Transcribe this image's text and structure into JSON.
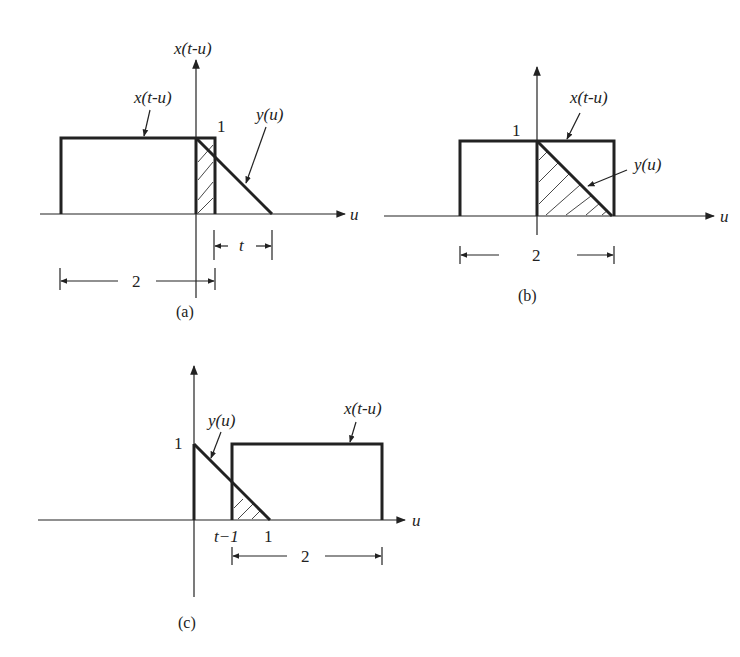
{
  "panels": {
    "a": {
      "caption": "(a)",
      "axis_title": "x(t-u)",
      "axis_label": "u",
      "rect_label": "x(t-u)",
      "tri_label": "y(u)",
      "height_label": "1",
      "width_label": "2",
      "shift_label": "t"
    },
    "b": {
      "caption": "(b)",
      "axis_label": "u",
      "rect_label": "x(t-u)",
      "tri_label": "y(u)",
      "height_label": "1",
      "width_label": "2"
    },
    "c": {
      "caption": "(c)",
      "axis_label": "u",
      "rect_label": "x(t-u)",
      "tri_label": "y(u)",
      "height_label": "1",
      "width_label": "2",
      "tick_left": "t−1",
      "tick_right": "1"
    }
  },
  "colors": {
    "stroke": "#222222",
    "background": "#ffffff"
  }
}
